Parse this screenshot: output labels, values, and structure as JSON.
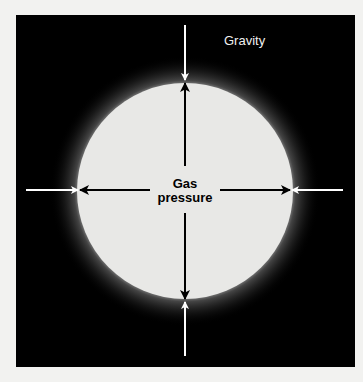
{
  "figure": {
    "background_color": "#000000",
    "star_color": "#e8e8e6",
    "labels": {
      "gravity": "Gravity",
      "gas_pressure_line1": "Gas",
      "gas_pressure_line2": "pressure"
    },
    "arrows": {
      "gravity_arrows": [
        "top",
        "bottom",
        "left",
        "right"
      ],
      "gravity_color": "#ffffff",
      "pressure_arrows": [
        "up",
        "down",
        "left",
        "right"
      ],
      "pressure_color": "#000000"
    }
  }
}
